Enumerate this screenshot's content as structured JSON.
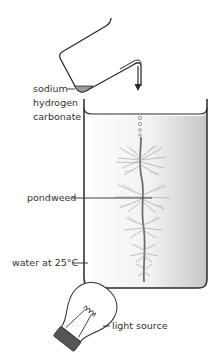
{
  "diagram": {
    "labels": {
      "sodium": "sodium",
      "hydrogen": "hydrogen",
      "carbonate": "carbonate",
      "pondweed": "pondweed",
      "water": "water at 25°C",
      "light": "light source"
    },
    "colors": {
      "outline": "#2b2b2b",
      "water_light": "#f7f7f7",
      "water_dark": "#c8c8c8",
      "pondweed": "#8a8a8a",
      "chemical": "#9a9a9a",
      "bulb_base": "#555555"
    }
  }
}
